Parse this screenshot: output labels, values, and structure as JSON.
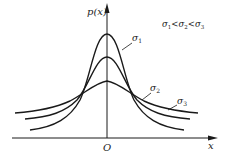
{
  "diagram": {
    "title": "",
    "y_axis_label": "p(x)",
    "x_axis_label": "x",
    "origin_label": "O",
    "relation": {
      "text": "σ1<σ2<σ3",
      "parts": [
        "σ",
        "1",
        "<",
        "σ",
        "2",
        "<",
        "σ",
        "3"
      ]
    },
    "curves": [
      {
        "name": "σ1",
        "symbol": "σ",
        "subscript": "1",
        "description": "narrowest, tallest normal density curve"
      },
      {
        "name": "σ2",
        "symbol": "σ",
        "subscript": "2",
        "description": "medium width normal density curve"
      },
      {
        "name": "σ3",
        "symbol": "σ",
        "subscript": "3",
        "description": "widest, flattest normal density curve"
      }
    ],
    "colors": {
      "stroke": "#1a1a1a",
      "background": "#ffffff"
    }
  }
}
